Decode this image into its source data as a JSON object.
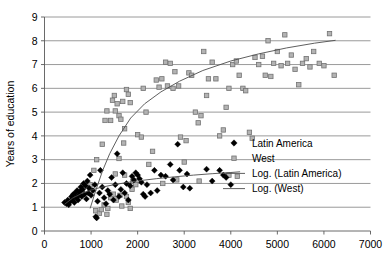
{
  "chart_data": {
    "type": "scatter",
    "title": "",
    "xlabel": "",
    "ylabel": "Years of education",
    "xlim": [
      0,
      7000
    ],
    "ylim": [
      0,
      9
    ],
    "xticks": [
      0,
      1000,
      2000,
      3000,
      4000,
      5000,
      6000,
      7000
    ],
    "yticks": [
      0,
      1,
      2,
      3,
      4,
      5,
      6,
      7,
      8,
      9
    ],
    "grid": "horizontal",
    "legend_position": "right-middle",
    "colors": {
      "latin_america": "#000000",
      "west": "#b3b3b3",
      "west_edge": "#737373",
      "trendline": "#4d4d4d",
      "gridline": "#808080",
      "axis": "#595959"
    },
    "legend": [
      {
        "label": "Latin America",
        "marker": "diamond"
      },
      {
        "label": "West",
        "marker": "square"
      },
      {
        "label": "Log. (Latin America)",
        "marker": "line"
      },
      {
        "label": "Log. (West)",
        "marker": "line"
      }
    ],
    "series": [
      {
        "name": "Latin America",
        "marker": "diamond",
        "points": [
          [
            430,
            1.2
          ],
          [
            470,
            1.15
          ],
          [
            500,
            1.3
          ],
          [
            520,
            1.1
          ],
          [
            560,
            1.25
          ],
          [
            580,
            1.45
          ],
          [
            600,
            1.35
          ],
          [
            620,
            1.55
          ],
          [
            640,
            1.2
          ],
          [
            660,
            1.6
          ],
          [
            680,
            1.4
          ],
          [
            700,
            1.7
          ],
          [
            720,
            1.3
          ],
          [
            740,
            1.5
          ],
          [
            760,
            1.65
          ],
          [
            780,
            1.85
          ],
          [
            800,
            1.45
          ],
          [
            820,
            1.75
          ],
          [
            840,
            2.0
          ],
          [
            860,
            1.55
          ],
          [
            880,
            1.9
          ],
          [
            900,
            1.35
          ],
          [
            920,
            2.1
          ],
          [
            940,
            1.6
          ],
          [
            960,
            1.8
          ],
          [
            980,
            2.35
          ],
          [
            1000,
            1.5
          ],
          [
            1040,
            1.7
          ],
          [
            1080,
            1.95
          ],
          [
            1100,
            0.6
          ],
          [
            1120,
            0.55
          ],
          [
            1140,
            1.25
          ],
          [
            1180,
            1.6
          ],
          [
            1200,
            2.55
          ],
          [
            1240,
            1.85
          ],
          [
            1280,
            1.4
          ],
          [
            1320,
            1.15
          ],
          [
            1360,
            1.7
          ],
          [
            1400,
            1.55
          ],
          [
            1440,
            2.25
          ],
          [
            1480,
            1.3
          ],
          [
            1520,
            1.95
          ],
          [
            1560,
            3.25
          ],
          [
            1600,
            1.45
          ],
          [
            1640,
            1.75
          ],
          [
            1680,
            2.45
          ],
          [
            1720,
            1.6
          ],
          [
            1760,
            2.0
          ],
          [
            1800,
            1.3
          ],
          [
            1840,
            1.9
          ],
          [
            1880,
            2.3
          ],
          [
            1920,
            2.15
          ],
          [
            1960,
            2.45
          ],
          [
            2000,
            2.35
          ],
          [
            2040,
            2.2
          ],
          [
            2080,
            2.05
          ],
          [
            2120,
            1.55
          ],
          [
            2160,
            1.45
          ],
          [
            2200,
            1.95
          ],
          [
            2280,
            1.6
          ],
          [
            2360,
            2.55
          ],
          [
            2420,
            1.7
          ],
          [
            2500,
            2.35
          ],
          [
            2600,
            2.3
          ],
          [
            2700,
            2.8
          ],
          [
            2760,
            2.15
          ],
          [
            2860,
            3.65
          ],
          [
            2900,
            2.55
          ],
          [
            2980,
            1.85
          ],
          [
            3060,
            2.4
          ],
          [
            3120,
            1.8
          ],
          [
            3480,
            2.6
          ],
          [
            3600,
            2.1
          ],
          [
            3760,
            2.55
          ],
          [
            3840,
            2.35
          ],
          [
            3900,
            2.25
          ],
          [
            4000,
            1.95
          ]
        ]
      },
      {
        "name": "West",
        "marker": "square",
        "points": [
          [
            980,
            1.95
          ],
          [
            1100,
            0.85
          ],
          [
            1180,
            0.75
          ],
          [
            1220,
            0.9
          ],
          [
            1280,
            1.1
          ],
          [
            1340,
            0.7
          ],
          [
            1360,
            0.95
          ],
          [
            1420,
            1.4
          ],
          [
            1480,
            1.55
          ],
          [
            1520,
            2.4
          ],
          [
            1540,
            1.3
          ],
          [
            1600,
            3.05
          ],
          [
            1620,
            1.5
          ],
          [
            1660,
            1.05
          ],
          [
            1700,
            3.7
          ],
          [
            1720,
            2.35
          ],
          [
            1760,
            1.45
          ],
          [
            1800,
            1.2
          ],
          [
            1840,
            0.95
          ],
          [
            1880,
            1.75
          ],
          [
            1060,
            2.55
          ],
          [
            1120,
            3.0
          ],
          [
            1240,
            3.65
          ],
          [
            1300,
            4.65
          ],
          [
            1340,
            5.05
          ],
          [
            1420,
            4.65
          ],
          [
            1460,
            5.5
          ],
          [
            1500,
            5.7
          ],
          [
            1520,
            5.05
          ],
          [
            1560,
            5.35
          ],
          [
            1600,
            4.85
          ],
          [
            1640,
            4.7
          ],
          [
            1680,
            5.45
          ],
          [
            1720,
            4.3
          ],
          [
            1760,
            5.95
          ],
          [
            1800,
            5.75
          ],
          [
            1840,
            5.4
          ],
          [
            1900,
            2.1
          ],
          [
            1960,
            1.95
          ],
          [
            2000,
            4.05
          ],
          [
            2080,
            3.95
          ],
          [
            2120,
            6.0
          ],
          [
            2180,
            5.0
          ],
          [
            2240,
            2.8
          ],
          [
            2320,
            3.35
          ],
          [
            2400,
            6.35
          ],
          [
            2460,
            6.05
          ],
          [
            2520,
            6.4
          ],
          [
            2600,
            7.1
          ],
          [
            2640,
            6.1
          ],
          [
            2700,
            7.05
          ],
          [
            2760,
            6.0
          ],
          [
            2800,
            6.7
          ],
          [
            2880,
            6.1
          ],
          [
            2920,
            3.95
          ],
          [
            3000,
            2.9
          ],
          [
            3040,
            3.8
          ],
          [
            3100,
            6.65
          ],
          [
            3160,
            6.55
          ],
          [
            3240,
            5.0
          ],
          [
            3300,
            4.55
          ],
          [
            3360,
            4.85
          ],
          [
            3420,
            7.55
          ],
          [
            3480,
            5.7
          ],
          [
            3520,
            6.4
          ],
          [
            3600,
            7.1
          ],
          [
            3680,
            6.4
          ],
          [
            3760,
            4.0
          ],
          [
            3840,
            4.25
          ],
          [
            3900,
            5.2
          ],
          [
            3960,
            6.0
          ],
          [
            4040,
            7.0
          ],
          [
            4120,
            7.15
          ],
          [
            4180,
            6.55
          ],
          [
            4260,
            6.0
          ],
          [
            4320,
            5.9
          ],
          [
            4400,
            4.15
          ],
          [
            4460,
            3.9
          ],
          [
            4520,
            7.3
          ],
          [
            4600,
            7.0
          ],
          [
            4680,
            7.35
          ],
          [
            4740,
            6.55
          ],
          [
            4800,
            8.0
          ],
          [
            4860,
            6.5
          ],
          [
            4920,
            7.05
          ],
          [
            5000,
            7.55
          ],
          [
            5080,
            6.95
          ],
          [
            5160,
            8.25
          ],
          [
            5220,
            7.05
          ],
          [
            5300,
            7.4
          ],
          [
            5380,
            6.8
          ],
          [
            5460,
            6.15
          ],
          [
            5540,
            7.05
          ],
          [
            5620,
            7.25
          ],
          [
            5700,
            6.9
          ],
          [
            5780,
            7.55
          ],
          [
            5900,
            7.05
          ],
          [
            6000,
            6.95
          ],
          [
            6120,
            8.3
          ],
          [
            6220,
            6.55
          ],
          [
            2540,
            2.0
          ],
          [
            2840,
            2.15
          ],
          [
            3320,
            2.1
          ],
          [
            3960,
            2.35
          ],
          [
            4140,
            2.3
          ]
        ]
      }
    ],
    "trendlines": [
      {
        "name": "Log. (Latin America)",
        "type": "logarithmic",
        "points": [
          [
            430,
            1.12
          ],
          [
            600,
            1.38
          ],
          [
            800,
            1.58
          ],
          [
            1000,
            1.72
          ],
          [
            1200,
            1.83
          ],
          [
            1500,
            1.95
          ],
          [
            1800,
            2.05
          ],
          [
            2100,
            2.13
          ],
          [
            2400,
            2.2
          ],
          [
            2800,
            2.28
          ],
          [
            3200,
            2.35
          ],
          [
            3600,
            2.41
          ],
          [
            4000,
            2.46
          ],
          [
            4200,
            2.49
          ]
        ]
      },
      {
        "name": "Log. (West)",
        "type": "logarithmic",
        "points": [
          [
            980,
            0.95
          ],
          [
            1100,
            1.7
          ],
          [
            1250,
            2.55
          ],
          [
            1400,
            3.25
          ],
          [
            1600,
            4.0
          ],
          [
            1850,
            4.75
          ],
          [
            2150,
            5.35
          ],
          [
            2500,
            5.85
          ],
          [
            2900,
            6.3
          ],
          [
            3400,
            6.75
          ],
          [
            4000,
            7.15
          ],
          [
            4600,
            7.45
          ],
          [
            5200,
            7.7
          ],
          [
            5800,
            7.9
          ],
          [
            6250,
            8.02
          ]
        ]
      }
    ]
  },
  "axes": {
    "y_title": "Years of education",
    "y_tick_labels": [
      "0",
      "1",
      "2",
      "3",
      "4",
      "5",
      "6",
      "7",
      "8",
      "9"
    ],
    "x_tick_labels": [
      "0",
      "1000",
      "2000",
      "3000",
      "4000",
      "5000",
      "6000",
      "7000"
    ]
  },
  "legend": {
    "items": [
      {
        "label": "Latin America"
      },
      {
        "label": "West"
      },
      {
        "label": "Log. (Latin America)"
      },
      {
        "label": "Log. (West)"
      }
    ]
  }
}
